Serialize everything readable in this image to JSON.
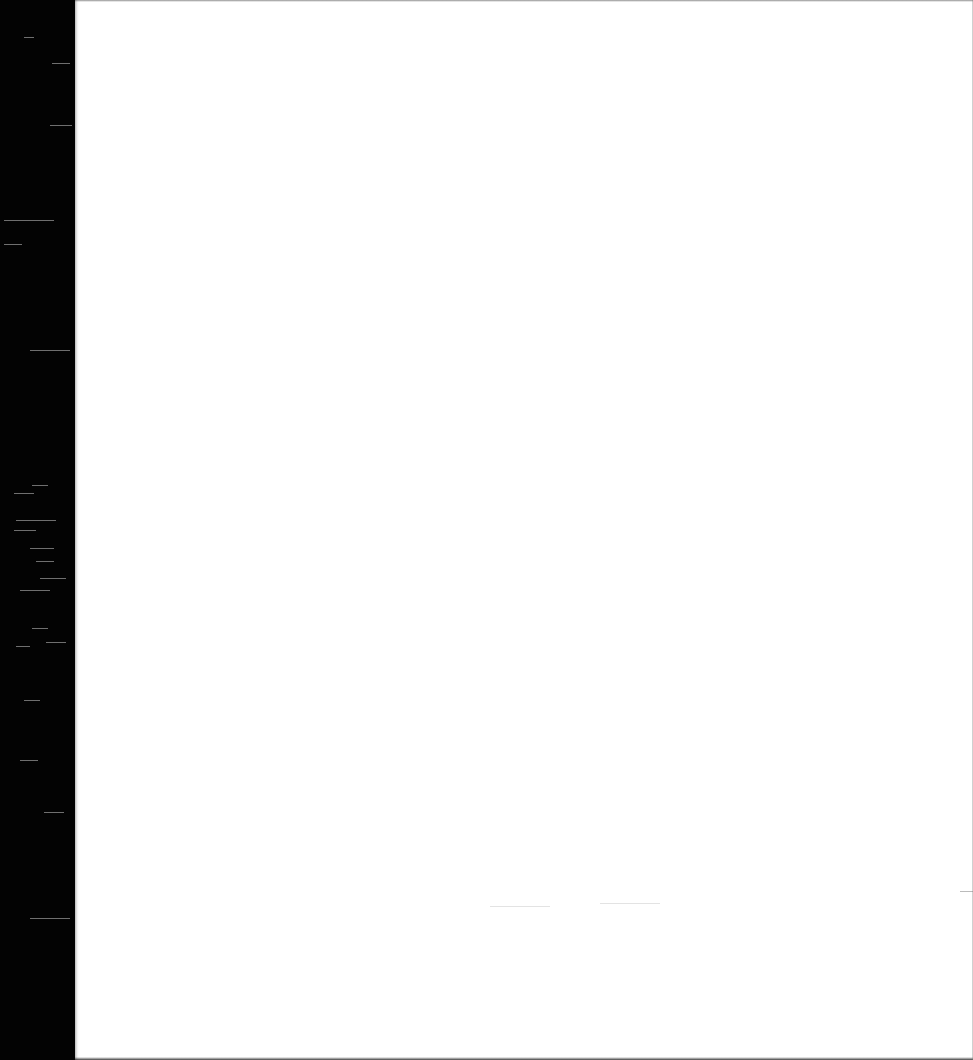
{
  "document": {
    "type": "scanned-page",
    "page_text": "",
    "colors": {
      "paper": "#ffffff",
      "scanner_background": "#030303"
    }
  }
}
